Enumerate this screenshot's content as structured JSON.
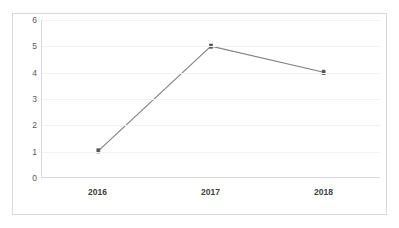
{
  "chart_data": {
    "type": "line",
    "title": "",
    "xlabel": "",
    "ylabel": "",
    "categories": [
      "2016",
      "2017",
      "2018"
    ],
    "values": [
      1,
      5,
      4
    ],
    "series": [
      {
        "name": "Series 1",
        "values": [
          1,
          5,
          4
        ]
      }
    ],
    "ylim": [
      0,
      6
    ],
    "yticks": [
      0,
      1,
      2,
      3,
      4,
      5,
      6
    ],
    "ytick_labels": [
      "0",
      "1",
      "2",
      "3",
      "4",
      "5",
      "6"
    ],
    "grid": "horizontal",
    "legend": "none",
    "colors": {
      "line": "#808080",
      "marker": "#595959",
      "grid": "#f2f2f2",
      "axis": "#d9d9d9",
      "border": "#d9d9d9",
      "xtick_text": "#404040",
      "ytick_text": "#595959",
      "background": "#ffffff"
    }
  }
}
